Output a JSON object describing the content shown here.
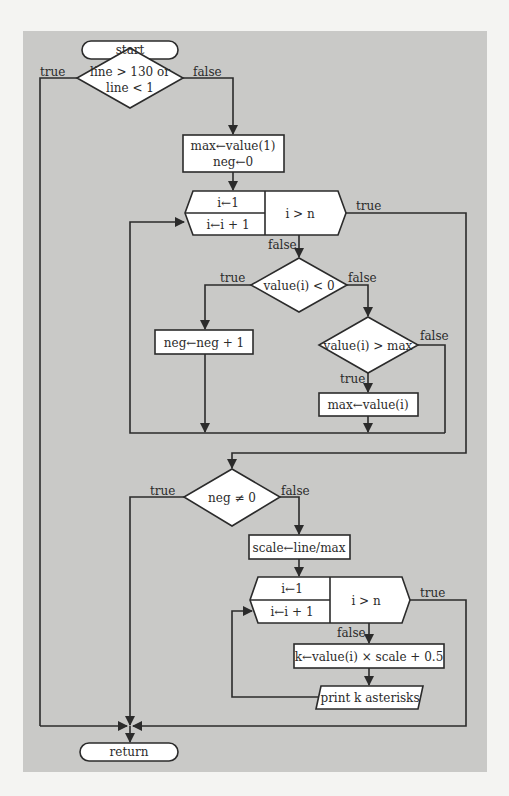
{
  "flowchart": {
    "terminals": {
      "start": "start",
      "return": "return"
    },
    "decisions": {
      "line_check_line1": "line > 130 or",
      "line_check_line2": "line < 1",
      "value_negative": "value(i) < 0",
      "value_greater_max": "value(i) > max",
      "neg_nonzero": "neg ≠ 0"
    },
    "processes": {
      "init_line1": "max←value(1)",
      "init_line2": "neg←0",
      "increment_neg": "neg←neg + 1",
      "update_max": "max←value(i)",
      "compute_scale": "scale←line/max",
      "compute_k": "k←value(i) × scale + 0.5"
    },
    "io": {
      "print": "print k asterisks"
    },
    "loops": [
      {
        "init": "i←1",
        "step": "i←i + 1",
        "condition": "i > n"
      },
      {
        "init": "i←1",
        "step": "i←i + 1",
        "condition": "i > n"
      }
    ],
    "edge_labels": {
      "d1_true": "true",
      "d1_false": "false",
      "loop1_true": "true",
      "loop1_false": "false",
      "d2_true": "true",
      "d2_false": "false",
      "d3_true": "true",
      "d3_false": "false",
      "d4_true": "true",
      "d4_false": "false",
      "loop2_true": "true",
      "loop2_false": "false"
    },
    "colors": {
      "panel": "#c9c9c7",
      "page": "#f4f4f2",
      "line": "#2b2b2b",
      "shape_fill": "#ffffff"
    }
  }
}
